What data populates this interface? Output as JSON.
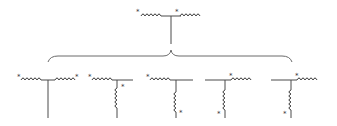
{
  "diagram": {
    "title": "",
    "polarity_mark": "*",
    "colors": {
      "line": "#4a4a4a",
      "brace": "#6a6a6a",
      "background": "#ffffff"
    },
    "top_circuit": {
      "description": "Two series coils joined at a center tap with a vertical stem",
      "left_coil_mark": "*",
      "right_coil_mark": "*"
    },
    "brace": {
      "description": "Curly brace grouping the five equivalent configurations"
    },
    "sub_circuits": [
      {
        "id": 1,
        "description": "Two horizontal coils with center-tap stem",
        "marks": [
          "*",
          "*"
        ]
      },
      {
        "id": 2,
        "description": "Horizontal coil plus vertical coil, mark at top of vertical",
        "marks": [
          "*",
          "*"
        ]
      },
      {
        "id": 3,
        "description": "Horizontal coil plus vertical coil, mark at bottom of vertical",
        "marks": [
          "*",
          "*"
        ]
      },
      {
        "id": 4,
        "description": "Vertical coil on left with horizontal coil on right, mark at bottom left",
        "marks": [
          "*",
          "*"
        ]
      },
      {
        "id": 5,
        "description": "Vertical coil on left with horizontal coil on right, mark at bottom left",
        "marks": [
          "*",
          "*"
        ]
      }
    ]
  }
}
